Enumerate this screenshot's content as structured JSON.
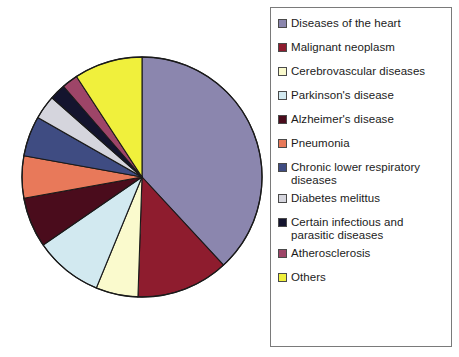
{
  "chart_data": {
    "type": "pie",
    "title": "",
    "legend_position": "right",
    "categories": [
      "Diseases of the heart",
      "Malignant neoplasm",
      "Cerebrovascular diseases",
      "Parkinson's disease",
      "Alzheimer's disease",
      "Pneumonia",
      "Chronic lower respiratory\ndiseases",
      "Diabetes melittus",
      "Certain infectious and\nparasitic diseases",
      "Atherosclerosis",
      "Others"
    ],
    "values": [
      39.2,
      12.8,
      5.8,
      9.4,
      6.9,
      5.8,
      5.6,
      3.3,
      2.2,
      2.2,
      9.4
    ],
    "angles_deg": [
      141.0,
      46.0,
      21.0,
      34.0,
      25.0,
      21.0,
      20.0,
      12.0,
      8.0,
      8.0,
      34.0
    ],
    "colors": [
      "#8b86ae",
      "#8e1c2e",
      "#fafacd",
      "#d2e9f0",
      "#4a0c1c",
      "#e8795a",
      "#3f4c82",
      "#d5d5dd",
      "#14142e",
      "#9e4568",
      "#f0f03c"
    ],
    "start_angle_deg": 0,
    "direction": "clockwise",
    "stroke_color": "#1a1a1a",
    "center": [
      142,
      177
    ],
    "radius": 120
  },
  "legend": {
    "items": [
      {
        "label": "Diseases of the heart",
        "color": "#8b86ae",
        "name": "diseases-of-the-heart"
      },
      {
        "label": "Malignant neoplasm",
        "color": "#8e1c2e",
        "name": "malignant-neoplasm"
      },
      {
        "label": "Cerebrovascular diseases",
        "color": "#fafacd",
        "name": "cerebrovascular-diseases"
      },
      {
        "label": "Parkinson's disease",
        "color": "#d2e9f0",
        "name": "parkinsons-disease"
      },
      {
        "label": "Alzheimer's disease",
        "color": "#4a0c1c",
        "name": "alzheimers-disease"
      },
      {
        "label": "Pneumonia",
        "color": "#e8795a",
        "name": "pneumonia"
      },
      {
        "label": "Chronic lower respiratory\ndiseases",
        "color": "#3f4c82",
        "name": "chronic-lower-respiratory-diseases"
      },
      {
        "label": "Diabetes melittus",
        "color": "#d5d5dd",
        "name": "diabetes-melittus"
      },
      {
        "label": "Certain infectious and\nparasitic diseases",
        "color": "#14142e",
        "name": "certain-infectious-and-parasitic-diseases"
      },
      {
        "label": "Atherosclerosis",
        "color": "#9e4568",
        "name": "atherosclerosis"
      },
      {
        "label": "Others",
        "color": "#f0f03c",
        "name": "others"
      }
    ]
  }
}
